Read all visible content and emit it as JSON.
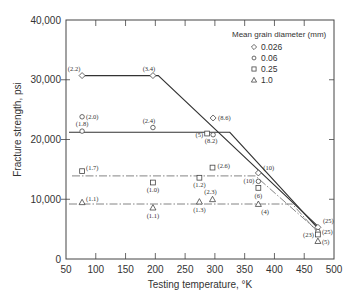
{
  "chart_data": {
    "type": "scatter",
    "title": "",
    "xlabel": "Testing temperature, °K",
    "ylabel": "Fracture strength, psi",
    "xlim": [
      50,
      500
    ],
    "ylim": [
      0,
      40000
    ],
    "xticks": [
      50,
      100,
      150,
      200,
      250,
      300,
      350,
      400,
      450,
      500
    ],
    "yticks": [
      0,
      10000,
      20000,
      30000,
      40000
    ],
    "ytick_labels": [
      "0",
      "10,000",
      "20,000",
      "30,000",
      "40,000"
    ],
    "xtick_labels": [
      "50",
      "100",
      "150",
      "200",
      "250",
      "300",
      "350",
      "400",
      "450",
      "500"
    ],
    "grid": false,
    "legend": {
      "title": "Mean grain diameter (mm)",
      "position": "upper right",
      "entries": [
        {
          "label": "0.026",
          "marker": "diamond"
        },
        {
          "label": "0.06",
          "marker": "circle"
        },
        {
          "label": "0.25",
          "marker": "square"
        },
        {
          "label": "1.0",
          "marker": "triangle"
        }
      ]
    },
    "series": [
      {
        "name": "0.026",
        "marker": "diamond",
        "points": [
          {
            "x": 77,
            "y": 30700,
            "label": "(2.2)"
          },
          {
            "x": 196,
            "y": 30700,
            "label": "(3.4)"
          },
          {
            "x": 297,
            "y": 23600,
            "label": "(8.6)"
          },
          {
            "x": 373,
            "y": 14400,
            "label": "(10)"
          },
          {
            "x": 473,
            "y": 5300,
            "label": "(25)"
          }
        ]
      },
      {
        "name": "0.06",
        "marker": "circle",
        "points": [
          {
            "x": 77,
            "y": 23800,
            "label": "(2.0)"
          },
          {
            "x": 77,
            "y": 21400,
            "label": "(1.8)"
          },
          {
            "x": 196,
            "y": 22000,
            "label": "(2.4)"
          },
          {
            "x": 297,
            "y": 20800,
            "label": "(8.2)"
          },
          {
            "x": 373,
            "y": 13000,
            "label": "(10)"
          },
          {
            "x": 473,
            "y": 4600,
            "label": "(25)"
          }
        ]
      },
      {
        "name": "0.25",
        "marker": "square",
        "points": [
          {
            "x": 77,
            "y": 14700,
            "label": "(1.7)"
          },
          {
            "x": 196,
            "y": 12800,
            "label": "(1.0)"
          },
          {
            "x": 274,
            "y": 13600,
            "label": "(1.2)"
          },
          {
            "x": 287,
            "y": 21000,
            "label": "(5)"
          },
          {
            "x": 296,
            "y": 15300,
            "label": "(2.6)"
          },
          {
            "x": 373,
            "y": 11900,
            "label": "(6)"
          },
          {
            "x": 473,
            "y": 4100,
            "label": "(23)"
          }
        ]
      },
      {
        "name": "1.0",
        "marker": "triangle",
        "points": [
          {
            "x": 77,
            "y": 9500,
            "label": "(1.1)"
          },
          {
            "x": 196,
            "y": 8600,
            "label": "(1.1)"
          },
          {
            "x": 274,
            "y": 9600,
            "label": "(1.3)"
          },
          {
            "x": 296,
            "y": 10000,
            "label": "(2.3)"
          },
          {
            "x": 373,
            "y": 9200,
            "label": "(4)"
          },
          {
            "x": 473,
            "y": 3000,
            "label": "(5)"
          }
        ]
      }
    ],
    "fit_lines": [
      {
        "name": "0.026",
        "style": "solid",
        "points": [
          [
            80,
            30700
          ],
          [
            205,
            30700
          ],
          [
            475,
            5300
          ]
        ]
      },
      {
        "name": "0.06",
        "style": "solid",
        "points": [
          [
            55,
            21200
          ],
          [
            325,
            21200
          ],
          [
            475,
            4900
          ]
        ]
      },
      {
        "name": "0.25",
        "style": "dash-dot",
        "points": [
          [
            60,
            13900
          ],
          [
            368,
            13900
          ],
          [
            475,
            4500
          ]
        ]
      },
      {
        "name": "1.0",
        "style": "dash-dot",
        "points": [
          [
            55,
            9200
          ],
          [
            430,
            9200
          ],
          [
            475,
            4200
          ]
        ]
      }
    ]
  }
}
